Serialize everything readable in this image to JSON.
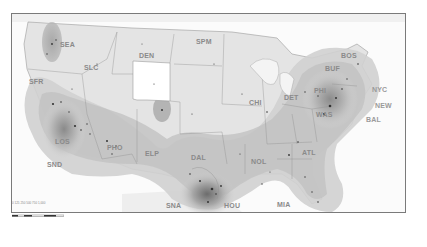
{
  "map": {
    "type": "density-map",
    "region": "Contiguous United States",
    "colors": {
      "background": "#ffffff",
      "land": "#e4e4e4",
      "land_highlight": "#ffffff",
      "density_light": "#d0d0d0",
      "density_medium": "#b4b4b4",
      "density_dark": "#7c7c7c",
      "border": "#8a8a8a",
      "label": "#8a8a8a",
      "frame": "#7a7a7a"
    },
    "labels": [
      {
        "code": "SEA",
        "x": 49,
        "y": 41
      },
      {
        "code": "SFR",
        "x": 29,
        "y": 78
      },
      {
        "code": "SLC",
        "x": 67,
        "y": 70
      },
      {
        "code": "DEN",
        "x": 139,
        "y": 56
      },
      {
        "code": "SPM",
        "x": 196,
        "y": 41
      },
      {
        "code": "CHI",
        "x": 247,
        "y": 107
      },
      {
        "code": "DET",
        "x": 285,
        "y": 96
      },
      {
        "code": "PHI",
        "x": 317,
        "y": 90
      },
      {
        "code": "BUF",
        "x": 329,
        "y": 68
      },
      {
        "code": "BOS",
        "x": 356,
        "y": 54
      },
      {
        "code": "NYC",
        "x": 373,
        "y": 87
      },
      {
        "code": "NEW",
        "x": 375,
        "y": 103
      },
      {
        "code": "BAL",
        "x": 366,
        "y": 119
      },
      {
        "code": "WAS",
        "x": 316,
        "y": 114
      },
      {
        "code": "LOS",
        "x": 50,
        "y": 141
      },
      {
        "code": "PHO",
        "x": 107,
        "y": 147
      },
      {
        "code": "ELP",
        "x": 146,
        "y": 152
      },
      {
        "code": "SND",
        "x": 47,
        "y": 165
      },
      {
        "code": "DAL",
        "x": 191,
        "y": 156
      },
      {
        "code": "NOL",
        "x": 251,
        "y": 160
      },
      {
        "code": "ATL",
        "x": 302,
        "y": 152
      },
      {
        "code": "SNA",
        "x": 166,
        "y": 205
      },
      {
        "code": "HOU",
        "x": 224,
        "y": 205
      },
      {
        "code": "MIA",
        "x": 277,
        "y": 204
      }
    ],
    "scale_bar": {
      "ticks": [
        "0",
        "125",
        "250",
        "500",
        "750",
        "1,000"
      ]
    }
  }
}
